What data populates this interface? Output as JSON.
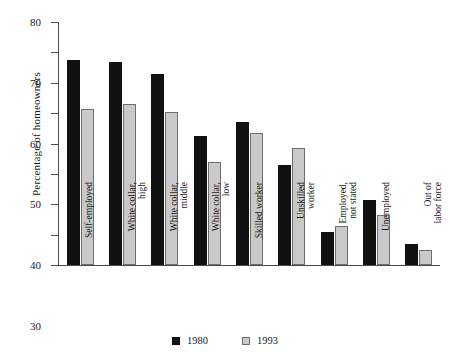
{
  "chart_data": {
    "type": "bar",
    "title": "",
    "xlabel": "",
    "ylabel": "Percentage of homeowners",
    "ylim": [
      0,
      80
    ],
    "yticks": [
      0,
      10,
      20,
      30,
      40,
      50,
      60,
      70,
      80
    ],
    "grid": false,
    "legend_position": "bottom",
    "categories": [
      "Self-employed",
      "White collar,\nhigh",
      "White collar,\nmiddle",
      "White collar,\nlow",
      "Skilled worker",
      "Unskilled\nworker",
      "Employed,\nnot stated",
      "Unemployed",
      "Out of\nlabor force"
    ],
    "series": [
      {
        "name": "1980",
        "color": "#111111",
        "values": [
          67.5,
          67.0,
          63.0,
          42.5,
          47.0,
          33.0,
          11.0,
          21.5,
          7.0
        ]
      },
      {
        "name": "1993",
        "color": "#c9c9c9",
        "values": [
          51.5,
          53.0,
          50.5,
          34.0,
          43.5,
          38.5,
          13.0,
          16.5,
          5.0
        ]
      }
    ]
  },
  "legend": {
    "entries": [
      {
        "label": "1980",
        "swatch": "filled-square-black"
      },
      {
        "label": "1993",
        "swatch": "filled-square-gray"
      }
    ]
  }
}
